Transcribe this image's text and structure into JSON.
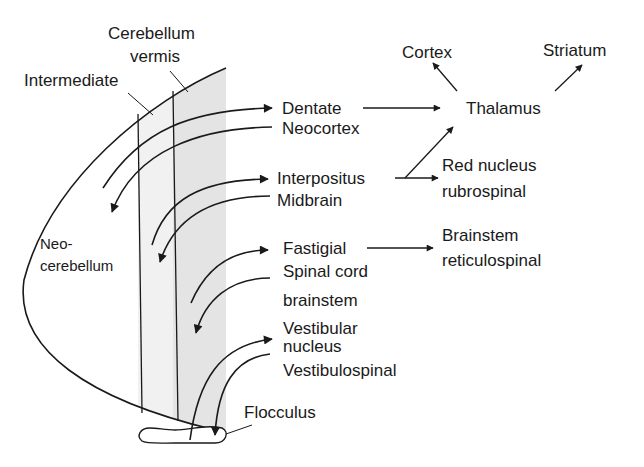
{
  "colors": {
    "ink": "#1a1a1a",
    "band_light": "#f1f1f1",
    "band_dark": "#e4e4e4",
    "background": "#ffffff"
  },
  "regions": {
    "vermis_line1": "Cerebellum",
    "vermis_line2": "vermis",
    "intermediate": "Intermediate",
    "neo_line1": "Neo-",
    "neo_line2": "cerebellum",
    "flocculus": "Flocculus"
  },
  "nuclei": {
    "dentate": "Dentate",
    "neocortex": "Neocortex",
    "interpositus": "Interpositus",
    "midbrain": "Midbrain",
    "fastigial": "Fastigial",
    "spinal_cord": "Spinal cord",
    "brainstem": "brainstem",
    "vestibular_line1": "Vestibular",
    "vestibular_line2": "nucleus",
    "vestibulospinal": "Vestibulospinal"
  },
  "targets": {
    "thalamus": "Thalamus",
    "cortex": "Cortex",
    "striatum": "Striatum",
    "red_nucleus_line1": "Red nucleus",
    "red_nucleus_line2": "rubrospinal",
    "brainstem_line1": "Brainstem",
    "brainstem_line2": "reticulospinal"
  },
  "connections": [
    {
      "from": "Neocortex",
      "to": "Neocerebellum"
    },
    {
      "from": "Neocerebellum",
      "to": "Dentate"
    },
    {
      "from": "Dentate",
      "to": "Thalamus"
    },
    {
      "from": "Thalamus",
      "to": "Cortex"
    },
    {
      "from": "Thalamus",
      "to": "Striatum"
    },
    {
      "from": "Midbrain",
      "to": "Intermediate"
    },
    {
      "from": "Intermediate",
      "to": "Interpositus"
    },
    {
      "from": "Interpositus",
      "to": "Red nucleus rubrospinal"
    },
    {
      "from": "Interpositus",
      "to": "Thalamus"
    },
    {
      "from": "Spinal cord brainstem",
      "to": "Vermis"
    },
    {
      "from": "Vermis",
      "to": "Fastigial"
    },
    {
      "from": "Fastigial",
      "to": "Brainstem reticulospinal"
    },
    {
      "from": "Vestibulospinal",
      "to": "Flocculus"
    },
    {
      "from": "Flocculus",
      "to": "Vestibular nucleus"
    }
  ]
}
